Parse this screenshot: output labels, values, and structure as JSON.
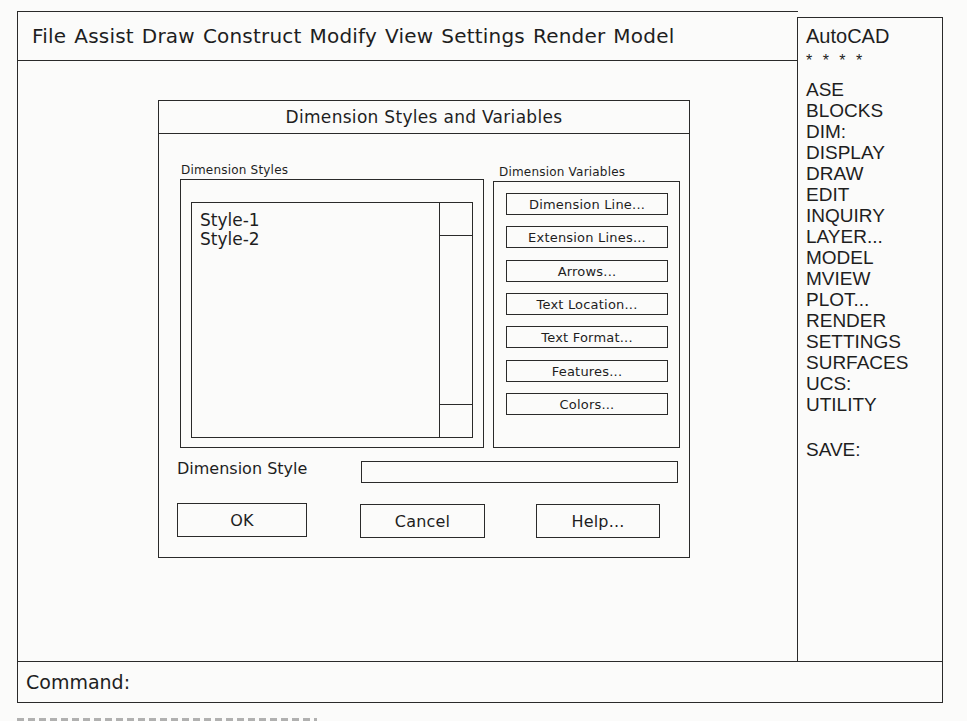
{
  "menubar": {
    "items": [
      "File",
      "Assist",
      "Draw",
      "Construct",
      "Modify",
      "View",
      "Settings",
      "Render",
      "Model"
    ]
  },
  "sidepanel": {
    "title": "AutoCAD",
    "separator": "* * * *",
    "items": [
      "ASE",
      "BLOCKS",
      "DIM:",
      "DISPLAY",
      "DRAW",
      "EDIT",
      "INQUIRY",
      "LAYER...",
      "MODEL",
      "MVIEW",
      "PLOT...",
      "RENDER",
      "SETTINGS",
      "SURFACES",
      "UCS:",
      "UTILITY"
    ],
    "footer_item": "SAVE:"
  },
  "dialog": {
    "title": "Dimension Styles and Variables",
    "styles_group_label": "Dimension Styles",
    "styles_list": [
      "Style-1",
      "Style-2"
    ],
    "variables_group_label": "Dimension Variables",
    "variable_buttons": [
      "Dimension Line...",
      "Extension Lines...",
      "Arrows...",
      "Text Location...",
      "Text Format...",
      "Features...",
      "Colors..."
    ],
    "dimension_style_label": "Dimension Style",
    "dimension_style_value": "",
    "ok_label": "OK",
    "cancel_label": "Cancel",
    "help_label": "Help..."
  },
  "command_bar": {
    "prompt": "Command:"
  }
}
